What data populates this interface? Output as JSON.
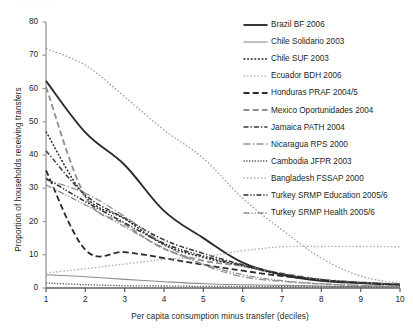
{
  "chart_data": {
    "type": "line",
    "title": "",
    "xlabel": "Per capita consumption minus transfer (deciles)",
    "ylabel": "Proportion of households receiving transfers",
    "x": [
      1,
      2,
      3,
      4,
      5,
      6,
      7,
      8,
      9,
      10
    ],
    "xticks": [
      "1",
      "2",
      "3",
      "4",
      "5",
      "6",
      "7",
      "8",
      "9",
      "10"
    ],
    "yticks": [
      "0",
      "10",
      "20",
      "30",
      "40",
      "50",
      "60",
      "70",
      "80"
    ],
    "xlim": [
      1,
      10
    ],
    "ylim": [
      0,
      80
    ],
    "grid": false,
    "legend_position": "upper right",
    "series": [
      {
        "name": "Brazil BF 2006",
        "style": "solid-thick",
        "color": "#2b2b2b",
        "values": [
          62.3,
          46.8,
          37.0,
          23.2,
          15.0,
          7.6,
          4.0,
          2.2,
          1.5,
          1.0
        ]
      },
      {
        "name": "Chile Solidario 2003",
        "style": "solid-thin",
        "color": "#8c8c8c",
        "values": [
          4.0,
          3.4,
          2.6,
          1.9,
          1.3,
          1.0,
          0.8,
          0.6,
          0.4,
          0.3
        ]
      },
      {
        "name": "Chile SUF 2003",
        "style": "dotted-coarse",
        "color": "#2b2b2b",
        "values": [
          47.0,
          27.5,
          20.8,
          13.0,
          9.2,
          6.6,
          4.0,
          2.4,
          1.6,
          1.1
        ]
      },
      {
        "name": "Ecuador BDH 2006",
        "style": "dotted-fine",
        "color": "#9b9b9b",
        "values": [
          72.0,
          67.0,
          57.5,
          47.5,
          39.0,
          27.0,
          17.5,
          9.0,
          3.6,
          1.4
        ]
      },
      {
        "name": "Honduras PRAF 2004/5",
        "style": "dashed-long",
        "color": "#2b2b2b",
        "values": [
          35.4,
          11.5,
          10.8,
          9.0,
          7.0,
          5.2,
          3.6,
          2.4,
          1.6,
          1.0
        ]
      },
      {
        "name": "Mexico Oportunidades 2004",
        "style": "dashed-long",
        "color": "#8f8f8f",
        "values": [
          60.5,
          27.5,
          19.2,
          11.8,
          8.2,
          6.6,
          4.4,
          2.6,
          1.7,
          1.1
        ]
      },
      {
        "name": "Jamaica PATH 2004",
        "style": "dash-dot",
        "color": "#3a3a3a",
        "values": [
          41.3,
          28.0,
          21.0,
          14.5,
          10.4,
          7.0,
          4.2,
          2.5,
          1.6,
          1.0
        ]
      },
      {
        "name": "Nicaragua RPS 2000",
        "style": "dash-dot-long",
        "color": "#8f8f8f",
        "values": [
          32.5,
          28.5,
          21.5,
          13.2,
          7.0,
          3.4,
          2.0,
          1.2,
          0.8,
          0.5
        ]
      },
      {
        "name": "Cambodia JFPR 2003",
        "style": "dotted-dense",
        "color": "#555555",
        "values": [
          1.5,
          1.0,
          0.7,
          0.6,
          0.5,
          0.5,
          0.4,
          0.4,
          0.3,
          0.3
        ]
      },
      {
        "name": "Bangladesh FSSAP 2000",
        "style": "dotted-light",
        "color": "#b0b0b0",
        "values": [
          4.5,
          5.8,
          7.2,
          8.6,
          9.4,
          11.2,
          12.4,
          12.5,
          12.5,
          12.4
        ]
      },
      {
        "name": "Turkey SRMP Education 2005/6",
        "style": "dash-dot-dot",
        "color": "#2b2b2b",
        "values": [
          33.0,
          26.0,
          19.6,
          13.4,
          9.6,
          6.8,
          4.2,
          2.4,
          1.5,
          0.9
        ]
      },
      {
        "name": "Turkey SRMP Health 2005/6",
        "style": "dash-dot-dot-grey",
        "color": "#8f8f8f",
        "values": [
          31.0,
          25.0,
          18.4,
          12.0,
          7.2,
          4.0,
          2.2,
          1.3,
          0.8,
          0.5
        ]
      }
    ]
  },
  "axes": {
    "y_ticks": [
      "80",
      "70",
      "60",
      "50",
      "40",
      "30",
      "20",
      "10",
      "0"
    ],
    "x_ticks": [
      "1",
      "2",
      "3",
      "4",
      "5",
      "6",
      "7",
      "8",
      "9",
      "10"
    ],
    "y_title": "Proportion of households receiving transfers",
    "x_title": "Per capita consumption minus transfer (deciles)"
  },
  "legend": {
    "items": [
      "Brazil BF 2006",
      "Chile Solidario 2003",
      "Chile SUF 2003",
      "Ecuador BDH 2006",
      "Honduras PRAF 2004/5",
      "Mexico Oportunidades 2004",
      "Jamaica PATH 2004",
      "Nicaragua RPS 2000",
      "Cambodia JFPR 2003",
      "Bangladesh FSSAP 2000",
      "Turkey SRMP Education 2005/6",
      "Turkey SRMP Health 2005/6"
    ]
  },
  "ghost_caption": "ꞏ  ꞏ  ꞏ  ꞏ  ꞏ"
}
